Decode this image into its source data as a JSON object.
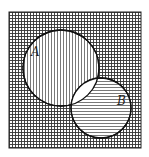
{
  "diagram": {
    "type": "venn",
    "universe": {
      "x": 9,
      "y": 12,
      "width": 132,
      "height": 136,
      "fill_pattern": "crosshatch"
    },
    "sets": [
      {
        "label": "A",
        "cx": 61,
        "cy": 68,
        "r": 38,
        "fill_pattern": "vertical-lines",
        "label_x": 31,
        "label_y": 56
      },
      {
        "label": "B",
        "cx": 101,
        "cy": 108,
        "r": 30,
        "fill_pattern": "horizontal-lines",
        "label_x": 117,
        "label_y": 105
      }
    ],
    "intersection": {
      "label": "A∩B",
      "fill": "blank"
    }
  }
}
